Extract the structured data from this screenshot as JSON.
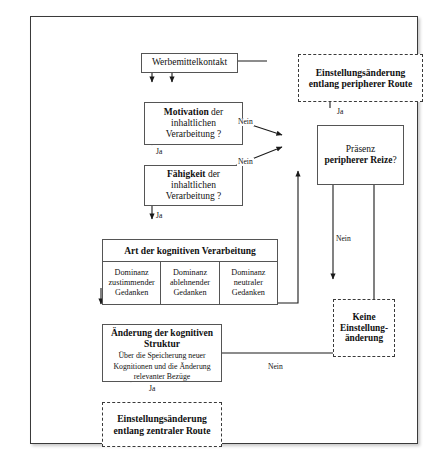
{
  "diagram": {
    "language": "de",
    "nodes": {
      "werbemittelkontakt": {
        "label": "Werbemittelkontakt",
        "shape": "rect-solid"
      },
      "motivation": {
        "line1_bold": "Motivation",
        "line1_rest": " der",
        "line2": "inhaltlichen",
        "line3": "Verarbeitung ?",
        "shape": "rect-solid"
      },
      "faehigkeit": {
        "line1_bold": "Fähigkeit",
        "line1_rest": " der",
        "line2": "inhaltlichen",
        "line3": "Verarbeitung ?",
        "shape": "rect-solid"
      },
      "praesenz": {
        "line1": "Präsenz",
        "line2_bold": "peripherer Reize",
        "line2_rest": "?",
        "shape": "rect-solid"
      },
      "periphere_route": {
        "line1": "Einstellungsänderung",
        "line2": "entlang peripherer Route",
        "shape": "rect-dashed"
      },
      "keine_einstellungsaenderung": {
        "line1": "Keine",
        "line2": "Einstellung-",
        "line3": "änderung",
        "shape": "rect-dashed"
      },
      "aenderung_kognitive_struktur": {
        "line1": "Änderung der kognitiven",
        "line2": "Struktur",
        "sub1": "Über die Speicherung neuer",
        "sub2": "Kognitionen und die Änderung",
        "sub3": "relevanter Bezüge",
        "shape": "rect-solid"
      },
      "zentrale_route": {
        "line1": "Einstellungsänderung",
        "line2": "entlang zentraler Route",
        "shape": "rect-dashed"
      }
    },
    "art_table": {
      "header": "Art der kognitiven Verarbeitung",
      "columns": [
        {
          "line1": "Dominanz",
          "line2": "zustimmender",
          "line3": "Gedanken"
        },
        {
          "line1": "Dominanz",
          "line2": "ablehnender",
          "line3": "Gedanken"
        },
        {
          "line1": "Dominanz",
          "line2": "neutraler",
          "line3": "Gedanken"
        }
      ]
    },
    "edge_labels": {
      "motivation_nein": "Nein",
      "motivation_ja": "Ja",
      "faehigkeit_nein": "Nein",
      "faehigkeit_ja": "Ja",
      "praesenz_ja": "Ja",
      "praesenz_nein": "Nein",
      "aenderung_ja": "Ja",
      "aenderung_nein": "Nein"
    },
    "colors": {
      "frame_border": "#3a3a3a",
      "box_border": "#555555",
      "line": "#1a1a1a",
      "text": "#111111",
      "background": "#ffffff"
    }
  }
}
